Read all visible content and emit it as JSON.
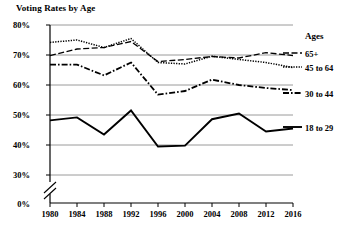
{
  "chart_data": {
    "type": "line",
    "title": "Voting Rates by Age",
    "xlabel": "",
    "ylabel": "",
    "x": [
      1980,
      1984,
      1988,
      1992,
      1996,
      2000,
      2004,
      2008,
      2012,
      2016
    ],
    "categories": [
      "1980",
      "1984",
      "1988",
      "1992",
      "1996",
      "2000",
      "2004",
      "2008",
      "2012",
      "2016"
    ],
    "ylim": [
      0,
      80
    ],
    "y_ticks": [
      "0%",
      "30%",
      "40%",
      "50%",
      "60%",
      "70%",
      "80%"
    ],
    "y_tick_values": [
      0,
      30,
      40,
      50,
      60,
      70,
      80
    ],
    "axis_break": true,
    "grid": "horizontal",
    "legend_position": "right",
    "legend_title": "Ages",
    "series": [
      {
        "name": "65+",
        "style": "dashed",
        "values": [
          69.8,
          72.0,
          72.5,
          74.5,
          67.8,
          68.5,
          69.5,
          69.0,
          70.8,
          69.8
        ]
      },
      {
        "name": "45 to 64",
        "style": "dotted",
        "values": [
          74.2,
          75.0,
          72.5,
          75.5,
          67.5,
          67.0,
          69.6,
          68.5,
          67.5,
          65.8
        ]
      },
      {
        "name": "30 to 44",
        "style": "dash-dot",
        "values": [
          66.8,
          66.8,
          63.2,
          67.5,
          56.8,
          58.0,
          61.8,
          60.0,
          59.0,
          58.3
        ]
      },
      {
        "name": "18 to 29",
        "style": "solid",
        "values": [
          48.2,
          49.2,
          43.5,
          51.5,
          39.5,
          39.8,
          48.6,
          50.5,
          44.5,
          45.5
        ]
      }
    ]
  },
  "legend": {
    "title": "Ages",
    "entries": [
      {
        "label": "65+"
      },
      {
        "label": "45 to 64"
      },
      {
        "label": "30 to 44"
      },
      {
        "label": "18 to 29"
      }
    ]
  },
  "axes": {
    "y_labels": [
      "80%",
      "70%",
      "60%",
      "50%",
      "40%",
      "30%",
      "0%"
    ],
    "x_labels": [
      "1980",
      "1984",
      "1988",
      "1992",
      "1996",
      "2000",
      "2004",
      "2008",
      "2012",
      "2016"
    ]
  }
}
